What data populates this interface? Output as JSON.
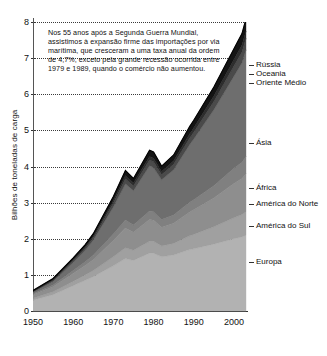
{
  "chart_data": {
    "type": "area",
    "title": "",
    "subtitle": "",
    "xlabel": "",
    "ylabel": "Bilhões de toneladas de carga",
    "xlim": [
      1950,
      2003
    ],
    "ylim": [
      0,
      8
    ],
    "grid": true,
    "stacked": true,
    "legend_position": "right-inline-labels",
    "xticks": [
      1950,
      1960,
      1970,
      1980,
      1990,
      2000
    ],
    "yticks": [
      0,
      1,
      2,
      3,
      4,
      5,
      6,
      7,
      8
    ],
    "annotation": "Nos 55 anos após a Segunda Guerra Mundial,\nassistimos à expansão firme das importações por via\nmarítima, que cresceram a uma taxa anual da ordem\nde 4,7%, exceto pela grande recessão ocorrida entre\n1979 e 1989, quando o comércio não aumentou.",
    "x": [
      1950,
      1955,
      1960,
      1963,
      1965,
      1970,
      1973,
      1975,
      1979,
      1980,
      1982,
      1985,
      1989,
      1990,
      1995,
      2000,
      2002,
      2003
    ],
    "series": [
      {
        "name": "Europa",
        "color": "#b2b2b2",
        "values": [
          0.3,
          0.45,
          0.7,
          0.85,
          0.95,
          1.25,
          1.45,
          1.4,
          1.6,
          1.6,
          1.5,
          1.55,
          1.7,
          1.72,
          1.85,
          2.0,
          2.05,
          2.1
        ]
      },
      {
        "name": "América do Sul",
        "color": "#a0a0a0",
        "values": [
          0.05,
          0.08,
          0.12,
          0.15,
          0.17,
          0.25,
          0.3,
          0.28,
          0.33,
          0.33,
          0.3,
          0.32,
          0.38,
          0.4,
          0.48,
          0.58,
          0.62,
          0.65
        ]
      },
      {
        "name": "América do Norte",
        "color": "#8e8e8e",
        "values": [
          0.1,
          0.14,
          0.22,
          0.26,
          0.3,
          0.45,
          0.55,
          0.5,
          0.6,
          0.58,
          0.52,
          0.56,
          0.66,
          0.68,
          0.8,
          0.95,
          1.0,
          1.05
        ]
      },
      {
        "name": "África",
        "color": "#808080",
        "values": [
          0.03,
          0.05,
          0.08,
          0.1,
          0.12,
          0.18,
          0.22,
          0.2,
          0.24,
          0.24,
          0.21,
          0.23,
          0.27,
          0.28,
          0.34,
          0.42,
          0.45,
          0.48
        ]
      },
      {
        "name": "Ásia",
        "color": "#6e6e6e",
        "values": [
          0.04,
          0.1,
          0.22,
          0.32,
          0.42,
          0.75,
          1.0,
          0.95,
          1.25,
          1.22,
          1.1,
          1.25,
          1.6,
          1.68,
          2.1,
          2.55,
          2.75,
          2.95
        ]
      },
      {
        "name": "Oriente Médio",
        "color": "#4a4a4a",
        "values": [
          0.02,
          0.03,
          0.05,
          0.06,
          0.07,
          0.11,
          0.14,
          0.13,
          0.16,
          0.16,
          0.14,
          0.15,
          0.18,
          0.19,
          0.23,
          0.28,
          0.3,
          0.32
        ]
      },
      {
        "name": "Oceania",
        "color": "#2e2e2e",
        "values": [
          0.01,
          0.02,
          0.03,
          0.04,
          0.04,
          0.07,
          0.09,
          0.08,
          0.1,
          0.1,
          0.09,
          0.1,
          0.12,
          0.12,
          0.15,
          0.18,
          0.19,
          0.2
        ]
      },
      {
        "name": "Rússia",
        "color": "#141414",
        "values": [
          0.02,
          0.03,
          0.05,
          0.06,
          0.07,
          0.11,
          0.14,
          0.13,
          0.17,
          0.17,
          0.15,
          0.16,
          0.2,
          0.21,
          0.25,
          0.3,
          0.32,
          0.34
        ]
      }
    ],
    "totals_note": "Total mundial de importações marítimas",
    "right_labels": [
      {
        "label": "Rússia",
        "value": 6.8
      },
      {
        "label": "Oceania",
        "value": 6.55
      },
      {
        "label": "Oriente Médio",
        "value": 6.3
      },
      {
        "label": "Ásia",
        "value": 4.65
      },
      {
        "label": "África",
        "value": 3.4
      },
      {
        "label": "América do Norte",
        "value": 2.95
      },
      {
        "label": "América do Sul",
        "value": 2.35
      },
      {
        "label": "Europa",
        "value": 1.35
      }
    ]
  }
}
